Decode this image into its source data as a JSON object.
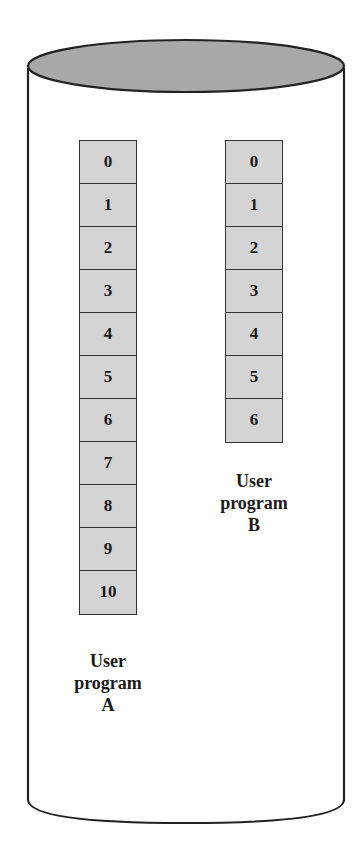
{
  "diagram": {
    "type": "disk-cylinder",
    "colors": {
      "top_fill": "#a8a8a8",
      "cell_fill": "#d4d4d4",
      "stroke": "#222222"
    },
    "programs": [
      {
        "id": "A",
        "label_line1": "User",
        "label_line2": "program",
        "label_line3": "A",
        "pages": [
          "0",
          "1",
          "2",
          "3",
          "4",
          "5",
          "6",
          "7",
          "8",
          "9",
          "10"
        ]
      },
      {
        "id": "B",
        "label_line1": "User",
        "label_line2": "program",
        "label_line3": "B",
        "pages": [
          "0",
          "1",
          "2",
          "3",
          "4",
          "5",
          "6"
        ]
      }
    ]
  }
}
